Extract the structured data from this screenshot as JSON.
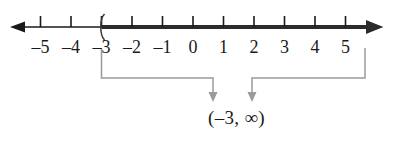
{
  "figure": {
    "name": "number-line-interval-graph",
    "background_color": "#ffffff",
    "axis_color": "#1a1a1a",
    "shading_color": "#2b2b2b",
    "leader_color": "#9a9a9a",
    "label_color": "#1a1a1a"
  },
  "number_line": {
    "left_arrow": "arrow-left",
    "right_arrow": "arrow-right",
    "axis_y": 27,
    "x_start": 10,
    "x_end": 383,
    "tick_spacing": 30.5,
    "tick_labels": [
      "–5",
      "–4",
      "–3",
      "–2",
      "–1",
      "0",
      "1",
      "2",
      "3",
      "4",
      "5"
    ],
    "tick_values": [
      -5,
      -4,
      -3,
      -2,
      -1,
      0,
      1,
      2,
      3,
      4,
      5
    ],
    "tick_x": [
      40.5,
      71,
      101.5,
      132,
      162.5,
      193,
      223.5,
      254,
      284.5,
      315,
      345.5
    ],
    "endpoint": {
      "symbol": "(",
      "value": -3,
      "x": 101.5,
      "type": "open-parenthesis",
      "included": false
    },
    "shading": {
      "from_x": 101.5,
      "to_x": 383,
      "direction": "right",
      "unbounded": true
    }
  },
  "annotation": {
    "left_leader": {
      "label": "leader-line-left-endpoint",
      "from_x": 101.5,
      "from_y": 48,
      "corner_y": 78,
      "to_x": 213,
      "arrow_y": 101
    },
    "right_leader": {
      "label": "leader-line-right-endpoint",
      "from_x": 365,
      "from_y": 48,
      "corner_y": 78,
      "to_x": 252,
      "arrow_y": 101
    },
    "interval_notation": "(–3, ∞)",
    "interval_lower": "–3",
    "interval_upper": "∞"
  }
}
